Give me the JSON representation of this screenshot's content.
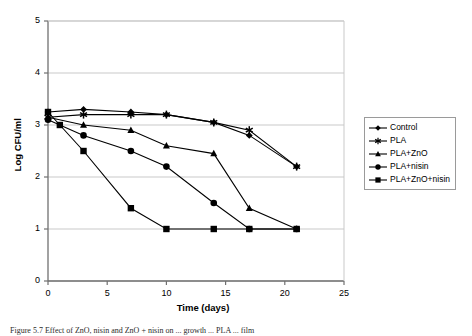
{
  "chart_data": {
    "type": "line",
    "title": "",
    "xlabel": "Time (days)",
    "ylabel": "Log CFU/ml",
    "xlim": [
      0,
      25
    ],
    "ylim": [
      0,
      5
    ],
    "xticks": [
      0,
      5,
      10,
      15,
      20,
      25
    ],
    "yticks": [
      0,
      1,
      2,
      3,
      4,
      5
    ],
    "grid": "horizontal",
    "legend_position": "right",
    "series": [
      {
        "name": "Control",
        "marker": "diamond",
        "x": [
          0,
          3,
          7,
          10,
          14,
          17,
          21
        ],
        "values": [
          3.25,
          3.3,
          3.25,
          3.2,
          3.05,
          2.8,
          2.2
        ]
      },
      {
        "name": "PLA",
        "marker": "asterisk",
        "x": [
          0,
          3,
          7,
          10,
          14,
          17,
          21
        ],
        "values": [
          3.15,
          3.2,
          3.2,
          3.2,
          3.05,
          2.9,
          2.2
        ]
      },
      {
        "name": "PLA+ZnO",
        "marker": "triangle",
        "x": [
          0,
          3,
          7,
          10,
          14,
          17,
          21
        ],
        "values": [
          3.15,
          3.0,
          2.9,
          2.6,
          2.45,
          1.4,
          1.0
        ]
      },
      {
        "name": "PLA+nisin",
        "marker": "circle",
        "x": [
          0,
          3,
          7,
          10,
          14,
          17,
          21
        ],
        "values": [
          3.1,
          2.8,
          2.5,
          2.2,
          1.5,
          1.0,
          1.0
        ]
      },
      {
        "name": "PLA+ZnO+nisin",
        "marker": "square",
        "x": [
          0,
          1,
          3,
          7,
          10,
          14,
          17,
          21
        ],
        "values": [
          3.25,
          3.0,
          2.5,
          1.4,
          1.0,
          1.0,
          1.0,
          1.0
        ]
      }
    ]
  },
  "axes": {
    "y_tick_labels": [
      "5",
      "4",
      "3",
      "2",
      "1",
      "0"
    ],
    "x_tick_labels": [
      "0",
      "5",
      "10",
      "15",
      "20",
      "25"
    ],
    "x_title": "Time (days)",
    "y_title": "Log CFU/ml"
  },
  "legend": {
    "items": [
      {
        "label": "Control",
        "marker": "diamond"
      },
      {
        "label": "PLA",
        "marker": "asterisk"
      },
      {
        "label": "PLA+ZnO",
        "marker": "triangle"
      },
      {
        "label": "PLA+nisin",
        "marker": "circle"
      },
      {
        "label": "PLA+ZnO+nisin",
        "marker": "square"
      }
    ]
  },
  "caption": {
    "text": "Figure 5.7   Effect of ZnO, nisin and ZnO + nisin on ... growth ... PLA ... film"
  },
  "colors": {
    "series": "#000000",
    "gridline": "#c9c9c9",
    "axis": "#808080",
    "background": "#ffffff"
  }
}
